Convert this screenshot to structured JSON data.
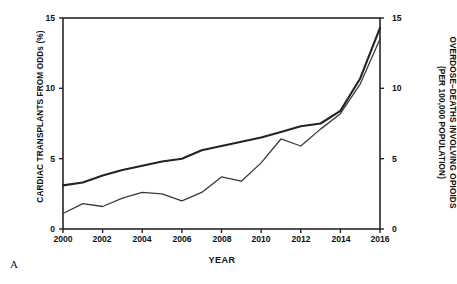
{
  "panel": {
    "label": "A"
  },
  "chart_data": {
    "type": "line",
    "title": "",
    "xlabel": "YEAR",
    "ylabel": "CARDIAC TRANSPLANTS FROM ODDs (%)",
    "y2label_line1": "OVERDOSE–DEATHS INVOLVING OPIOIDS",
    "y2label_line2": "(PER 100,000 POPULATION)",
    "grid": false,
    "legend": "none",
    "xlim": [
      2000,
      2016
    ],
    "ylim": [
      0,
      15
    ],
    "y2lim": [
      0,
      15
    ],
    "xticks": [
      "2000",
      "2002",
      "2004",
      "2006",
      "2008",
      "2010",
      "2012",
      "2014",
      "2016"
    ],
    "yticks": [
      "0",
      "5",
      "10",
      "15"
    ],
    "y2ticks": [
      "0",
      "5",
      "10",
      "15"
    ],
    "x": [
      2000,
      2001,
      2002,
      2003,
      2004,
      2005,
      2006,
      2007,
      2008,
      2009,
      2010,
      2011,
      2012,
      2013,
      2014,
      2015,
      2016
    ],
    "series": [
      {
        "name": "CARDIAC TRANSPLANTS FROM ODDs (%)",
        "axis": "left",
        "color": "#232323",
        "width": 2.1,
        "values": [
          3.1,
          3.3,
          3.8,
          4.2,
          4.5,
          4.8,
          5.0,
          5.6,
          5.9,
          6.2,
          6.5,
          6.9,
          7.3,
          7.5,
          8.4,
          10.7,
          14.3
        ]
      },
      {
        "name": "OVERDOSE–DEATHS INVOLVING OPIOIDS (PER 100,000 POPULATION)",
        "axis": "right",
        "color": "#3a3a3a",
        "width": 1.3,
        "values": [
          1.1,
          1.8,
          1.6,
          2.2,
          2.6,
          2.5,
          2.0,
          2.6,
          3.7,
          3.4,
          4.7,
          6.4,
          5.9,
          7.1,
          8.2,
          10.3,
          13.5
        ]
      }
    ]
  }
}
